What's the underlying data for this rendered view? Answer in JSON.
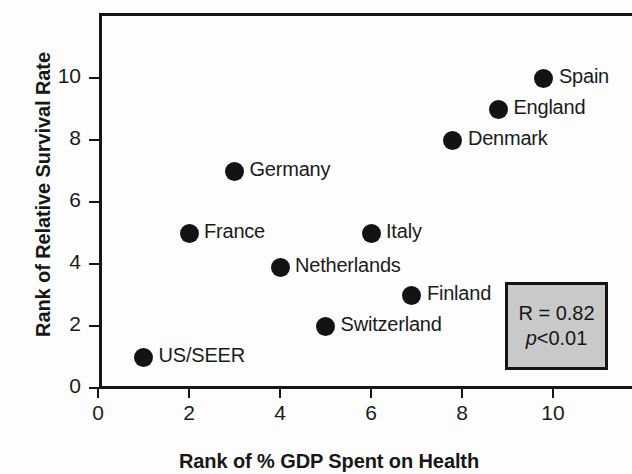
{
  "chart_data": {
    "type": "scatter",
    "title": "",
    "xlabel": "Rank of % GDP Spent on Health",
    "ylabel": "Rank of Relative Survival Rate",
    "xlim": [
      0,
      11.7
    ],
    "ylim": [
      0,
      12.1
    ],
    "xticks": [
      "0",
      "2",
      "4",
      "6",
      "8",
      "10"
    ],
    "xtick_values": [
      0,
      2,
      4,
      6,
      8,
      10
    ],
    "yticks": [
      "0",
      "2",
      "4",
      "6",
      "8",
      "10"
    ],
    "ytick_values": [
      0,
      2,
      4,
      6,
      8,
      10
    ],
    "grid": false,
    "legend_position": "lower-right",
    "points": [
      {
        "label": "US/SEER",
        "x": 1.0,
        "y": 1.0
      },
      {
        "label": "France",
        "x": 2.0,
        "y": 5.0
      },
      {
        "label": "Germany",
        "x": 3.0,
        "y": 7.0
      },
      {
        "label": "Netherlands",
        "x": 4.0,
        "y": 3.9
      },
      {
        "label": "Switzerland",
        "x": 5.0,
        "y": 2.0
      },
      {
        "label": "Italy",
        "x": 6.0,
        "y": 5.0
      },
      {
        "label": "Finland",
        "x": 6.9,
        "y": 3.0
      },
      {
        "label": "Denmark",
        "x": 7.8,
        "y": 8.0
      },
      {
        "label": "England",
        "x": 8.8,
        "y": 9.0
      },
      {
        "label": "Spain",
        "x": 9.8,
        "y": 10.0
      }
    ],
    "annotations": {
      "correlation": "R = 0.82",
      "pvalue_italic": "p",
      "pvalue_rest": "<0.01"
    }
  },
  "axes": {
    "x_title": "Rank of % GDP Spent on Health",
    "y_title": "Rank of Relative Survival Rate"
  },
  "stats": {
    "correlation": "R = 0.82",
    "p_symbol": "p",
    "p_value": "<0.01"
  },
  "colors": {
    "marker": "#131313",
    "axis": "#161616",
    "text": "#1b1b1b",
    "box_fill": "#c9c9c9",
    "box_border": "#141414",
    "background": "#ffffff"
  }
}
